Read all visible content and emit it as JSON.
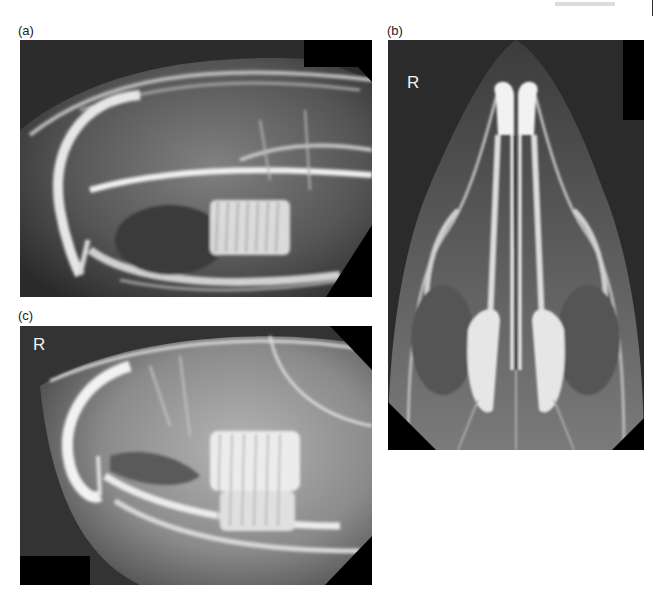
{
  "page_header": {
    "running_text": "",
    "has_rule": true
  },
  "figure": {
    "panels": [
      {
        "id": "a",
        "label": "(a)",
        "view": "lateral",
        "orientation_marker": "",
        "bbox": {
          "x": 20,
          "y": 40,
          "w": 352,
          "h": 257
        }
      },
      {
        "id": "b",
        "label": "(b)",
        "view": "dorsoventral",
        "orientation_marker": "R",
        "bbox": {
          "x": 388,
          "y": 40,
          "w": 256,
          "h": 410
        }
      },
      {
        "id": "c",
        "label": "(c)",
        "view": "lateral oblique",
        "orientation_marker": "R",
        "bbox": {
          "x": 20,
          "y": 326,
          "w": 352,
          "h": 259
        }
      }
    ]
  },
  "colors": {
    "background": "#ffffff",
    "film_dark": "#2e2e2e",
    "film_mid": "#6e6e6e",
    "bone_bright": "#e8e8e8",
    "mask_black": "#000000",
    "label_text": "#222222",
    "marker_text": "#f2f2f2"
  }
}
